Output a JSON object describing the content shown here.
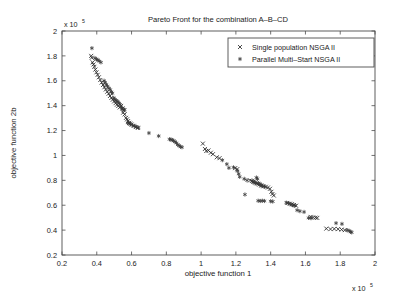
{
  "figure": {
    "background": "#ffffff",
    "axis_color": "#4d4d4d",
    "text_color": "#1a1a1a"
  },
  "chart_data": {
    "type": "scatter",
    "title": "Pareto Front for the combination A–B–CD",
    "xlabel": "objective function 1",
    "ylabel": "objective function 2b",
    "x_exponent_label": "x 10",
    "x_exponent_power": "5",
    "y_exponent_label": "x 10",
    "y_exponent_power": "5",
    "xlim": [
      0.2,
      2.0
    ],
    "ylim": [
      0.2,
      2.0
    ],
    "xticks": [
      "0.2",
      "0.4",
      "0.6",
      "0.8",
      "1",
      "1.2",
      "1.4",
      "1.6",
      "1.8",
      "2"
    ],
    "yticks": [
      "0.2",
      "0.4",
      "0.6",
      "0.8",
      "1",
      "1.2",
      "1.4",
      "1.6",
      "1.8",
      "2"
    ],
    "grid": false,
    "legend_position": "top-right",
    "marker_colors": {
      "single": "#2b2b2b",
      "parallel": "#3a3a3a"
    },
    "series": [
      {
        "name": "Single population NSGA II",
        "marker": "x",
        "points": [
          [
            0.368,
            1.8
          ],
          [
            0.371,
            1.785
          ],
          [
            0.376,
            1.748
          ],
          [
            0.381,
            1.731
          ],
          [
            0.386,
            1.712
          ],
          [
            0.392,
            1.69
          ],
          [
            0.398,
            1.668
          ],
          [
            0.405,
            1.648
          ],
          [
            0.412,
            1.628
          ],
          [
            0.42,
            1.606
          ],
          [
            0.428,
            1.586
          ],
          [
            0.436,
            1.566
          ],
          [
            0.444,
            1.548
          ],
          [
            0.452,
            1.53
          ],
          [
            0.46,
            1.512
          ],
          [
            0.468,
            1.496
          ],
          [
            0.476,
            1.478
          ],
          [
            0.484,
            1.462
          ],
          [
            0.492,
            1.448
          ],
          [
            0.5,
            1.434
          ],
          [
            0.508,
            1.42
          ],
          [
            0.516,
            1.408
          ],
          [
            0.524,
            1.398
          ],
          [
            0.532,
            1.386
          ],
          [
            0.54,
            1.398
          ],
          [
            0.548,
            1.378
          ],
          [
            0.556,
            1.362
          ],
          [
            0.552,
            1.344
          ],
          [
            0.56,
            1.33
          ],
          [
            0.568,
            1.302
          ],
          [
            0.574,
            1.29
          ],
          [
            0.58,
            1.276
          ],
          [
            0.586,
            1.262
          ],
          [
            0.592,
            1.256
          ],
          [
            0.6,
            1.248
          ],
          [
            0.612,
            1.238
          ],
          [
            0.624,
            1.228
          ],
          [
            0.636,
            1.222
          ],
          [
            1.01,
            1.095
          ],
          [
            1.022,
            1.052
          ],
          [
            1.03,
            1.036
          ],
          [
            1.042,
            1.04
          ],
          [
            1.056,
            1.022
          ],
          [
            1.068,
            1.01
          ],
          [
            1.09,
            0.985
          ],
          [
            1.106,
            0.978
          ],
          [
            1.196,
            0.898
          ],
          [
            1.208,
            0.89
          ],
          [
            1.282,
            0.8
          ],
          [
            1.292,
            0.795
          ],
          [
            1.3,
            0.788
          ],
          [
            1.31,
            0.782
          ],
          [
            1.318,
            0.776
          ],
          [
            1.326,
            0.772
          ],
          [
            1.334,
            0.766
          ],
          [
            1.346,
            0.758
          ],
          [
            1.358,
            0.752
          ],
          [
            1.372,
            0.748
          ],
          [
            1.384,
            0.742
          ],
          [
            1.396,
            0.732
          ],
          [
            1.404,
            0.708
          ],
          [
            1.41,
            0.69
          ],
          [
            1.418,
            0.678
          ],
          [
            1.496,
            0.618
          ],
          [
            1.51,
            0.612
          ],
          [
            1.522,
            0.608
          ],
          [
            1.534,
            0.602
          ],
          [
            1.546,
            0.596
          ],
          [
            1.63,
            0.506
          ],
          [
            1.644,
            0.502
          ],
          [
            1.658,
            0.5
          ],
          [
            1.668,
            0.498
          ],
          [
            1.72,
            0.412
          ],
          [
            1.744,
            0.408
          ],
          [
            1.766,
            0.41
          ],
          [
            1.788,
            0.408
          ],
          [
            1.808,
            0.404
          ],
          [
            1.826,
            0.4
          ]
        ]
      },
      {
        "name": "Parallel Multi–Start NSGA II",
        "marker": "asterisk",
        "points": [
          [
            0.372,
            1.862
          ],
          [
            0.39,
            1.782
          ],
          [
            0.398,
            1.772
          ],
          [
            0.406,
            1.768
          ],
          [
            0.414,
            1.758
          ],
          [
            0.424,
            1.748
          ],
          [
            0.442,
            1.6
          ],
          [
            0.448,
            1.586
          ],
          [
            0.455,
            1.57
          ],
          [
            0.462,
            1.556
          ],
          [
            0.47,
            1.54
          ],
          [
            0.478,
            1.528
          ],
          [
            0.484,
            1.51
          ],
          [
            0.49,
            1.5
          ],
          [
            0.498,
            1.462
          ],
          [
            0.504,
            1.45
          ],
          [
            0.51,
            1.442
          ],
          [
            0.516,
            1.436
          ],
          [
            0.522,
            1.43
          ],
          [
            0.528,
            1.42
          ],
          [
            0.534,
            1.41
          ],
          [
            0.54,
            1.39
          ],
          [
            0.546,
            1.376
          ],
          [
            0.552,
            1.37
          ],
          [
            0.56,
            1.368
          ],
          [
            0.578,
            1.262
          ],
          [
            0.586,
            1.258
          ],
          [
            0.594,
            1.252
          ],
          [
            0.606,
            1.242
          ],
          [
            0.618,
            1.236
          ],
          [
            0.628,
            1.228
          ],
          [
            0.64,
            1.222
          ],
          [
            0.7,
            1.18
          ],
          [
            0.756,
            1.156
          ],
          [
            0.818,
            1.13
          ],
          [
            0.826,
            1.128
          ],
          [
            0.834,
            1.124
          ],
          [
            0.842,
            1.118
          ],
          [
            0.85,
            1.11
          ],
          [
            0.858,
            1.1
          ],
          [
            0.866,
            1.086
          ],
          [
            0.874,
            1.078
          ],
          [
            0.882,
            1.07
          ],
          [
            0.89,
            1.066
          ],
          [
            1.122,
            0.962
          ],
          [
            1.148,
            0.93
          ],
          [
            1.16,
            0.9
          ],
          [
            1.186,
            0.904
          ],
          [
            1.208,
            0.876
          ],
          [
            1.216,
            0.852
          ],
          [
            1.222,
            0.828
          ],
          [
            1.248,
            0.812
          ],
          [
            1.264,
            0.8
          ],
          [
            1.296,
            0.792
          ],
          [
            1.304,
            0.786
          ],
          [
            1.312,
            0.78
          ],
          [
            1.318,
            0.822
          ],
          [
            1.324,
            0.812
          ],
          [
            1.33,
            0.776
          ],
          [
            1.338,
            0.768
          ],
          [
            1.346,
            0.76
          ],
          [
            1.252,
            0.686
          ],
          [
            1.352,
            0.756
          ],
          [
            1.364,
            0.75
          ],
          [
            1.328,
            0.636
          ],
          [
            1.34,
            0.634
          ],
          [
            1.352,
            0.636
          ],
          [
            1.364,
            0.634
          ],
          [
            1.4,
            0.632
          ],
          [
            1.412,
            0.63
          ],
          [
            1.49,
            0.62
          ],
          [
            1.502,
            0.616
          ],
          [
            1.516,
            0.608
          ],
          [
            1.528,
            0.6
          ],
          [
            1.54,
            0.598
          ],
          [
            1.552,
            0.56
          ],
          [
            1.568,
            0.552
          ],
          [
            1.592,
            0.546
          ],
          [
            1.618,
            0.498
          ],
          [
            1.632,
            0.496
          ],
          [
            1.776,
            0.456
          ],
          [
            1.81,
            0.45
          ],
          [
            1.84,
            0.4
          ],
          [
            1.852,
            0.394
          ],
          [
            1.86,
            0.386
          ],
          [
            1.866,
            0.382
          ]
        ]
      }
    ]
  },
  "legend": {
    "entries": [
      {
        "label": "Single population NSGA II",
        "marker": "x"
      },
      {
        "label": "Parallel Multi–Start NSGA II",
        "marker": "asterisk"
      }
    ]
  }
}
